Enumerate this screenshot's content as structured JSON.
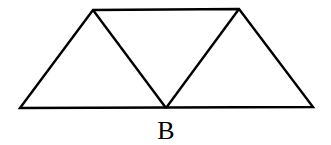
{
  "diagram": {
    "type": "geometry-figure",
    "stroke_color": "#000000",
    "background": "#ffffff",
    "points": {
      "top_left": [
        93,
        10
      ],
      "top_right": [
        239,
        9
      ],
      "bottom_left": [
        20,
        108
      ],
      "B": [
        166,
        108
      ],
      "bottom_right": [
        313,
        107
      ]
    },
    "labels": [
      {
        "text": "B",
        "x": 166,
        "y": 139
      }
    ]
  }
}
